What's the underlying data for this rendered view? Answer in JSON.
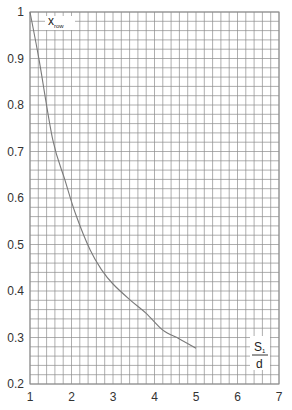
{
  "chart_data": {
    "type": "line",
    "title": "",
    "xlabel": "S1/d",
    "ylabel": "x_row",
    "ylabel_main": "x",
    "ylabel_sub": "row",
    "xlabel_num": "S",
    "xlabel_num_sub": "1",
    "xlabel_den": "d",
    "xlim": [
      1,
      7
    ],
    "ylim": [
      0.2,
      1.0
    ],
    "x_ticks": [
      1,
      2,
      3,
      4,
      5,
      6,
      7
    ],
    "x_tick_labels": [
      "1",
      "2",
      "3",
      "4",
      "5",
      "6",
      "7"
    ],
    "y_ticks": [
      0.2,
      0.3,
      0.4,
      0.5,
      0.6,
      0.7,
      0.8,
      0.9,
      1.0
    ],
    "y_tick_labels": [
      "0.2",
      "0.3",
      "0.4",
      "0.5",
      "0.6",
      "0.7",
      "0.8",
      "0.9",
      "1"
    ],
    "grid": true,
    "grid_minor_x_step": 0.2,
    "grid_minor_y_step": 0.02,
    "legend": null,
    "series": [
      {
        "name": "x_row",
        "x": [
          1.0,
          1.22,
          1.55,
          1.84,
          2.1,
          2.45,
          2.73,
          3.0,
          3.41,
          3.8,
          4.2,
          4.6,
          5.0
        ],
        "values": [
          1.0,
          0.897,
          0.725,
          0.639,
          0.565,
          0.488,
          0.445,
          0.415,
          0.381,
          0.352,
          0.316,
          0.297,
          0.277
        ]
      }
    ]
  },
  "colors": {
    "grid": "#8c8c8c",
    "curve": "#7a7a7a",
    "text": "#333333",
    "background": "#ffffff"
  }
}
